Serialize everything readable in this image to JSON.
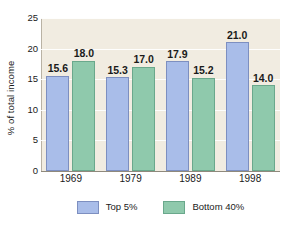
{
  "chart_data": {
    "type": "bar",
    "title": "",
    "xlabel": "",
    "ylabel": "% of total income",
    "categories": [
      "1969",
      "1979",
      "1989",
      "1998"
    ],
    "series": [
      {
        "name": "Top 5%",
        "color": "#a9bde9",
        "values": [
          15.6,
          15.3,
          17.9,
          21.0
        ],
        "labels": [
          "15.6",
          "15.3",
          "17.9",
          "21.0"
        ]
      },
      {
        "name": "Bottom 40%",
        "color": "#8fc9ac",
        "values": [
          18.0,
          17.0,
          15.2,
          14.0
        ],
        "labels": [
          "18.0",
          "17.0",
          "15.2",
          "14.0"
        ]
      }
    ],
    "ylim": [
      0,
      25
    ],
    "yticks": [
      0,
      5,
      10,
      15,
      20,
      25
    ],
    "ytick_labels": [
      "0",
      "5",
      "10",
      "15",
      "20",
      "25"
    ],
    "grid": true,
    "grid_axis": "y",
    "legend_position": "bottom",
    "plot_background": "#f1ece1",
    "figure_background": "#ffffff",
    "gridline_color": "#ffffff"
  },
  "axis": {
    "y_title": "% of total income",
    "y_ticks": [
      "0",
      "5",
      "10",
      "15",
      "20",
      "25"
    ],
    "x_ticks": [
      "1969",
      "1979",
      "1989",
      "1998"
    ]
  },
  "legend": {
    "items": [
      {
        "label": "Top 5%",
        "color": "#a9bde9"
      },
      {
        "label": "Bottom 40%",
        "color": "#8fc9ac"
      }
    ]
  }
}
